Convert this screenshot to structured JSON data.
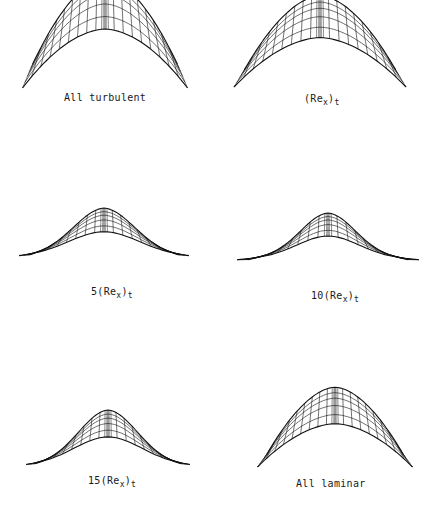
{
  "figure": {
    "panels": [
      {
        "id": "all-turbulent",
        "label": "All turbulent",
        "prefix": "",
        "apex": [
          105,
          23
        ],
        "left": [
          23,
          88
        ],
        "right": [
          188,
          88
        ],
        "base": 62,
        "shape": "dome",
        "label_pos": [
          64,
          93
        ]
      },
      {
        "id": "re-t",
        "label": "(Re_x)_t",
        "prefix": "",
        "apex": [
          320,
          28
        ],
        "left": [
          234,
          85
        ],
        "right": [
          406,
          89
        ],
        "base": 68,
        "shape": "dome",
        "label_pos": [
          303,
          94
        ]
      },
      {
        "id": "5-re-t",
        "label": "5(Re_x)_t",
        "prefix": "5",
        "apex": [
          104,
          217
        ],
        "left": [
          20,
          257
        ],
        "right": [
          190,
          256
        ],
        "base": 258,
        "shape": "bell",
        "label_pos": [
          91,
          287
        ]
      },
      {
        "id": "10-re-t",
        "label": "10(Re_x)_t",
        "prefix": "10",
        "apex": [
          328,
          222
        ],
        "left": [
          238,
          259
        ],
        "right": [
          420,
          261
        ],
        "base": 262,
        "shape": "bell-wide",
        "label_pos": [
          311,
          291
        ]
      },
      {
        "id": "15-re-t",
        "label": "15(Re_x)_t",
        "prefix": "15",
        "apex": [
          108,
          419
        ],
        "left": [
          30,
          465
        ],
        "right": [
          194,
          466
        ],
        "base": 462,
        "shape": "bell",
        "label_pos": [
          88,
          476
        ]
      },
      {
        "id": "all-laminar",
        "label": "All laminar",
        "prefix": "",
        "apex": [
          335,
          411
        ],
        "left": [
          250,
          467
        ],
        "right": [
          405,
          467
        ],
        "base": 453,
        "shape": "dome",
        "label_pos": [
          296,
          479
        ]
      }
    ],
    "label_parts": {
      "all-turbulent": {
        "text": "All turbulent"
      },
      "re-t": {
        "open": "(Re",
        "sub1": "x",
        "close": ")",
        "sub2": "t"
      },
      "5-re-t": {
        "pre": "5",
        "open": "(Re",
        "sub1": "x",
        "close": ")",
        "sub2": "t"
      },
      "10-re-t": {
        "pre": "10",
        "open": "(Re",
        "sub1": "x",
        "close": ")",
        "sub2": "t"
      },
      "15-re-t": {
        "pre": "15",
        "open": "(Re",
        "sub1": "x",
        "close": ")",
        "sub2": "t"
      },
      "all-laminar": {
        "text": "All laminar"
      }
    },
    "line_color": "#111111"
  }
}
